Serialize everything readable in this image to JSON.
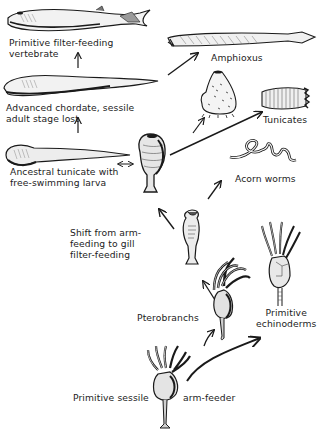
{
  "diagram": {
    "type": "evolutionary-tree",
    "background": "#ffffff",
    "ink_color": "#1a1a1a",
    "nodes": [
      {
        "id": "vertebrate",
        "label_lines": [
          "Primitive  filter-feeding",
          "vertebrate"
        ]
      },
      {
        "id": "advanced_chordate",
        "label_lines": [
          "Advanced  chordate,  sessile",
          "adult  stage  lost"
        ]
      },
      {
        "id": "ancestral_tunicate",
        "label_lines": [
          "Ancestral  tunicate  with",
          "free-swimming  larva"
        ]
      },
      {
        "id": "amphioxus",
        "label_lines": [
          "Amphioxus"
        ]
      },
      {
        "id": "tunicates",
        "label_lines": [
          "Tunicates"
        ]
      },
      {
        "id": "acorn_worms",
        "label_lines": [
          "Acorn  worms"
        ]
      },
      {
        "id": "shift",
        "label_lines": [
          "Shift  from  arm-",
          "feeding  to  gill",
          "filter-feeding"
        ]
      },
      {
        "id": "pterobranchs",
        "label_lines": [
          "Pterobranchs"
        ]
      },
      {
        "id": "echinoderms",
        "label_lines": [
          "Primitive",
          "echinoderms"
        ]
      },
      {
        "id": "sessile_armfeeder",
        "label_lines": [
          "Primitive  sessile",
          "arm-feeder"
        ]
      }
    ],
    "edges": [
      {
        "from": "sessile_armfeeder",
        "to": "pterobranchs"
      },
      {
        "from": "sessile_armfeeder",
        "to": "echinoderms"
      },
      {
        "from": "pterobranchs",
        "to": "shift"
      },
      {
        "from": "shift",
        "to": "ancestral_tunicate"
      },
      {
        "from": "shift",
        "to": "acorn_worms"
      },
      {
        "from": "ancestral_tunicate",
        "to": "tunicates"
      },
      {
        "from": "ancestral_tunicate",
        "to": "amphioxus"
      },
      {
        "from": "ancestral_tunicate",
        "to": "advanced_chordate"
      },
      {
        "from": "advanced_chordate",
        "to": "vertebrate"
      }
    ]
  }
}
